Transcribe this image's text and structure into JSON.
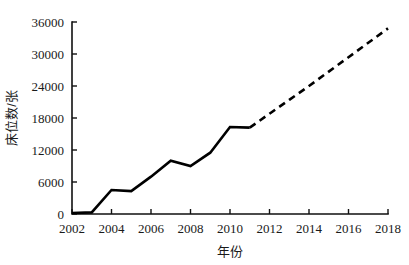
{
  "chart_data": {
    "type": "line",
    "title": "",
    "xlabel": "年份",
    "ylabel": "床位数/张",
    "xlim": [
      2002,
      2018
    ],
    "ylim": [
      0,
      36000
    ],
    "grid": false,
    "legend": "none",
    "x_ticks": [
      "2002",
      "2004",
      "2006",
      "2008",
      "2010",
      "2012",
      "2014",
      "2016",
      "2018"
    ],
    "x_tick_values": [
      2002,
      2004,
      2006,
      2008,
      2010,
      2012,
      2014,
      2016,
      2018
    ],
    "y_ticks": [
      "0",
      "6000",
      "12000",
      "18000",
      "24000",
      "30000",
      "36000"
    ],
    "y_tick_values": [
      0,
      6000,
      12000,
      18000,
      24000,
      30000,
      36000
    ],
    "x": [
      2002,
      2003,
      2004,
      2005,
      2006,
      2007,
      2008,
      2009,
      2010,
      2011,
      2012,
      2013,
      2014,
      2015,
      2016,
      2017,
      2018
    ],
    "series": [
      {
        "name": "实际值",
        "style": "solid",
        "x": [
          2002,
          2003,
          2004,
          2005,
          2006,
          2007,
          2008,
          2009,
          2010,
          2011
        ],
        "values": [
          200,
          300,
          4500,
          4300,
          7000,
          10000,
          9000,
          11500,
          16300,
          16200
        ]
      },
      {
        "name": "预测值",
        "style": "dashed",
        "x": [
          2011,
          2012,
          2013,
          2014,
          2015,
          2016,
          2017,
          2018
        ],
        "values": [
          16200,
          18800,
          21400,
          24000,
          26700,
          29400,
          32100,
          34800
        ]
      }
    ],
    "annotations": []
  },
  "figure": {
    "background_color": "#ffffff",
    "line_color": "#000000",
    "text_color": "#1a1a1a"
  }
}
